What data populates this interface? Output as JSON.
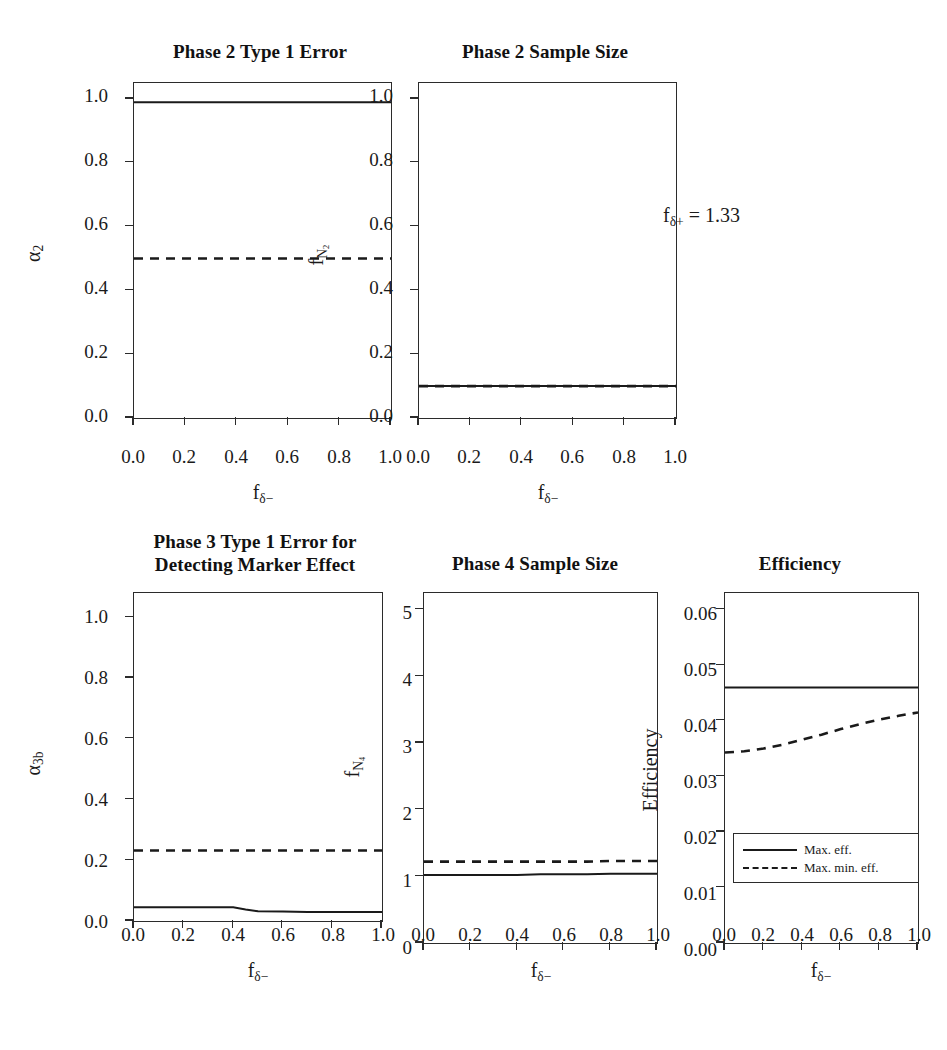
{
  "figure": {
    "annotation": "fδ+ = 1.33",
    "annotation_parts": {
      "base": "f",
      "sub": "δ+",
      "value": " = 1.33"
    },
    "background": "#ffffff",
    "line_color": "#1a1a1a"
  },
  "axis_labels": {
    "x_common_base": "f",
    "x_common_sub": "δ−",
    "x_common": "fδ−"
  },
  "legend": {
    "position": "bottom-right-inside-efficiency-panel",
    "entries": [
      {
        "label": "Max. eff.",
        "style": "solid"
      },
      {
        "label": "Max. min. eff.",
        "style": "dashed"
      }
    ]
  },
  "chart_data": [
    {
      "id": "phase2-type1-error",
      "type": "line",
      "title": "Phase 2 Type 1 Error",
      "xlabel": "fδ−",
      "ylabel": "α2",
      "ylabel_base": "α",
      "ylabel_sub": "2",
      "xlim": [
        0.0,
        1.0
      ],
      "ylim": [
        0.0,
        1.05
      ],
      "xticks": [
        0.0,
        0.2,
        0.4,
        0.6,
        0.8,
        1.0
      ],
      "xticklabels": [
        "0.0",
        "0.2",
        "0.4",
        "0.6",
        "0.8",
        "1.0"
      ],
      "yticks": [
        0.0,
        0.2,
        0.4,
        0.6,
        0.8,
        1.0
      ],
      "yticklabels": [
        "0.0",
        "0.2",
        "0.4",
        "0.6",
        "0.8",
        "1.0"
      ],
      "grid": false,
      "x": [
        0.0,
        0.1,
        0.2,
        0.3,
        0.4,
        0.5,
        0.6,
        0.7,
        0.8,
        0.9,
        1.0
      ],
      "series": [
        {
          "name": "Max. eff.",
          "style": "solid",
          "values": [
            0.99,
            0.99,
            0.99,
            0.99,
            0.99,
            0.99,
            0.99,
            0.99,
            0.99,
            0.99,
            0.99
          ]
        },
        {
          "name": "Max. min. eff.",
          "style": "dashed",
          "values": [
            0.5,
            0.5,
            0.5,
            0.5,
            0.5,
            0.5,
            0.5,
            0.5,
            0.5,
            0.5,
            0.5
          ]
        }
      ]
    },
    {
      "id": "phase2-sample-size",
      "type": "line",
      "title": "Phase 2 Sample Size",
      "xlabel": "fδ−",
      "ylabel": "fN2",
      "ylabel_base": "f",
      "ylabel_sub": "N",
      "ylabel_subsub": "2",
      "xlim": [
        0.0,
        1.0
      ],
      "ylim": [
        0.0,
        1.05
      ],
      "xticks": [
        0.0,
        0.2,
        0.4,
        0.6,
        0.8,
        1.0
      ],
      "xticklabels": [
        "0.0",
        "0.2",
        "0.4",
        "0.6",
        "0.8",
        "1.0"
      ],
      "yticks": [
        0.0,
        0.2,
        0.4,
        0.6,
        0.8,
        1.0
      ],
      "yticklabels": [
        "0.0",
        "0.2",
        "0.4",
        "0.6",
        "0.8",
        "1.0"
      ],
      "grid": false,
      "x": [
        0.0,
        0.1,
        0.2,
        0.3,
        0.4,
        0.5,
        0.6,
        0.7,
        0.8,
        0.9,
        1.0
      ],
      "series": [
        {
          "name": "Max. eff.",
          "style": "solid",
          "values": [
            0.1,
            0.1,
            0.1,
            0.1,
            0.1,
            0.1,
            0.1,
            0.1,
            0.1,
            0.1,
            0.1
          ]
        },
        {
          "name": "Max. min. eff.",
          "style": "dashed",
          "values": [
            0.1,
            0.1,
            0.1,
            0.1,
            0.1,
            0.1,
            0.1,
            0.1,
            0.1,
            0.1,
            0.1
          ]
        }
      ]
    },
    {
      "id": "phase3-type1-error",
      "type": "line",
      "title": "Phase 3 Type 1 Error for\nDetecting Marker Effect",
      "xlabel": "fδ−",
      "ylabel": "α3b",
      "ylabel_base": "α",
      "ylabel_sub": "3b",
      "xlim": [
        0.0,
        1.0
      ],
      "ylim": [
        0.0,
        1.08
      ],
      "xticks": [
        0.0,
        0.2,
        0.4,
        0.6,
        0.8,
        1.0
      ],
      "xticklabels": [
        "0.0",
        "0.2",
        "0.4",
        "0.6",
        "0.8",
        "1.0"
      ],
      "yticks": [
        0.0,
        0.2,
        0.4,
        0.6,
        0.8,
        1.0
      ],
      "yticklabels": [
        "0.0",
        "0.2",
        "0.4",
        "0.6",
        "0.8",
        "1.0"
      ],
      "grid": false,
      "x": [
        0.0,
        0.1,
        0.2,
        0.3,
        0.4,
        0.45,
        0.5,
        0.6,
        0.7,
        0.8,
        0.9,
        1.0
      ],
      "series": [
        {
          "name": "Max. eff.",
          "style": "solid",
          "values": [
            0.045,
            0.045,
            0.045,
            0.045,
            0.045,
            0.038,
            0.032,
            0.031,
            0.03,
            0.03,
            0.03,
            0.03
          ]
        },
        {
          "name": "Max. min. eff.",
          "style": "dashed",
          "values": [
            0.232,
            0.232,
            0.232,
            0.232,
            0.232,
            0.232,
            0.232,
            0.232,
            0.232,
            0.232,
            0.232,
            0.232
          ]
        }
      ]
    },
    {
      "id": "phase4-sample-size",
      "type": "line",
      "title": "Phase 4 Sample Size",
      "xlabel": "fδ−",
      "ylabel": "fN4",
      "ylabel_base": "f",
      "ylabel_sub": "N",
      "ylabel_subsub": "4",
      "xlim": [
        0.0,
        1.0
      ],
      "ylim": [
        0.0,
        5.25
      ],
      "xticks": [
        0.0,
        0.2,
        0.4,
        0.6,
        0.8,
        1.0
      ],
      "xticklabels": [
        "0.0",
        "0.2",
        "0.4",
        "0.6",
        "0.8",
        "1.0"
      ],
      "yticks": [
        0,
        1,
        2,
        3,
        4,
        5
      ],
      "yticklabels": [
        "0",
        "1",
        "2",
        "3",
        "4",
        "5"
      ],
      "grid": false,
      "x": [
        0.0,
        0.1,
        0.2,
        0.3,
        0.4,
        0.5,
        0.6,
        0.7,
        0.8,
        0.9,
        1.0
      ],
      "series": [
        {
          "name": "Max. eff.",
          "style": "solid",
          "values": [
            1.02,
            1.02,
            1.02,
            1.02,
            1.02,
            1.03,
            1.03,
            1.03,
            1.04,
            1.04,
            1.04
          ]
        },
        {
          "name": "Max. min. eff.",
          "style": "dashed",
          "values": [
            1.22,
            1.22,
            1.22,
            1.22,
            1.22,
            1.22,
            1.22,
            1.22,
            1.23,
            1.23,
            1.23
          ]
        }
      ]
    },
    {
      "id": "efficiency",
      "type": "line",
      "title": "Efficiency",
      "xlabel": "fδ−",
      "ylabel": "Efficiency",
      "xlim": [
        0.0,
        1.0
      ],
      "ylim": [
        0.0,
        0.063
      ],
      "xticks": [
        0.0,
        0.2,
        0.4,
        0.6,
        0.8,
        1.0
      ],
      "xticklabels": [
        "0.0",
        "0.2",
        "0.4",
        "0.6",
        "0.8",
        "1.0"
      ],
      "yticks": [
        0.0,
        0.01,
        0.02,
        0.03,
        0.04,
        0.05,
        0.06
      ],
      "yticklabels": [
        "0.00",
        "0.01",
        "0.02",
        "0.03",
        "0.04",
        "0.05",
        "0.06"
      ],
      "grid": false,
      "x": [
        0.0,
        0.1,
        0.2,
        0.3,
        0.4,
        0.5,
        0.6,
        0.7,
        0.8,
        0.9,
        1.0
      ],
      "series": [
        {
          "name": "Max. eff.",
          "style": "solid",
          "values": [
            0.046,
            0.046,
            0.046,
            0.046,
            0.046,
            0.046,
            0.046,
            0.046,
            0.046,
            0.046,
            0.046
          ]
        },
        {
          "name": "Max. min. eff.",
          "style": "dashed",
          "values": [
            0.0343,
            0.0345,
            0.035,
            0.0357,
            0.0366,
            0.0375,
            0.0385,
            0.0394,
            0.0402,
            0.0409,
            0.0415
          ]
        }
      ]
    }
  ]
}
